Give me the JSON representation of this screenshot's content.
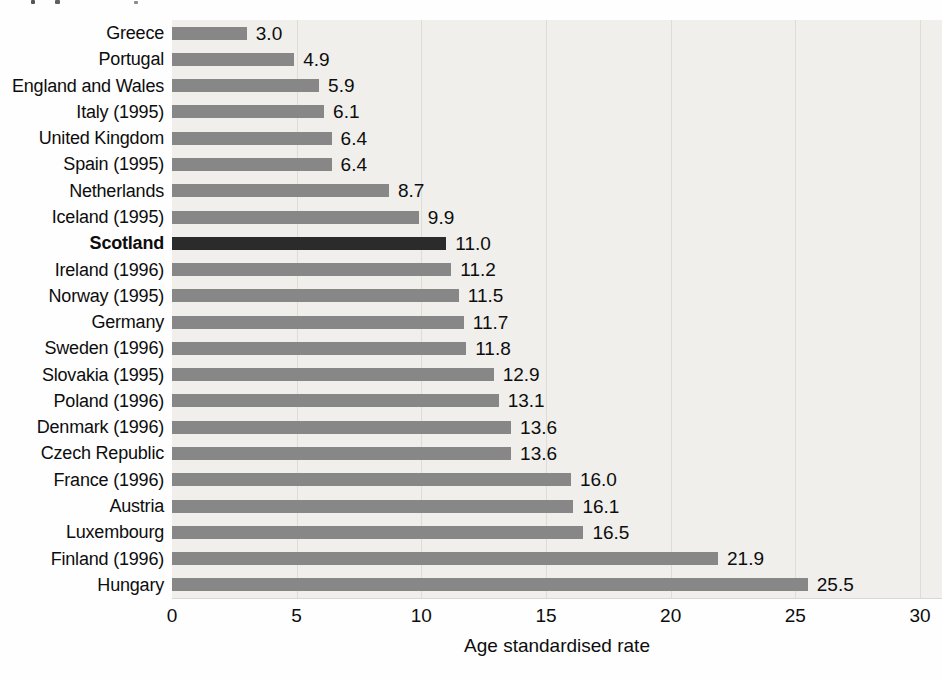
{
  "figure": {
    "background": "#fefefe",
    "text_color": "#0d0d0d"
  },
  "chart_data": {
    "type": "bar",
    "orientation": "horizontal",
    "title": "",
    "xlabel": "Age standardised rate",
    "ylabel": "",
    "xlim": [
      0,
      30.9
    ],
    "xticks": [
      "0",
      "5",
      "10",
      "15",
      "20",
      "25",
      "30"
    ],
    "grid": true,
    "legend": false,
    "plot_background": "#f0efec",
    "gridline_color": "#dddcd7",
    "bar_color": "#878787",
    "highlight_color": "#2b2b2b",
    "highlight_label": "Scotland",
    "categories": [
      "Greece",
      "Portugal",
      "England and Wales",
      "Italy (1995)",
      "United Kingdom",
      "Spain (1995)",
      "Netherlands",
      "Iceland (1995)",
      "Scotland",
      "Ireland (1996)",
      "Norway (1995)",
      "Germany",
      "Sweden (1996)",
      "Slovakia (1995)",
      "Poland (1996)",
      "Denmark (1996)",
      "Czech Republic",
      "France (1996)",
      "Austria",
      "Luxembourg",
      "Finland (1996)",
      "Hungary"
    ],
    "values": [
      3.0,
      4.9,
      5.9,
      6.1,
      6.4,
      6.4,
      8.7,
      9.9,
      11.0,
      11.2,
      11.5,
      11.7,
      11.8,
      12.9,
      13.1,
      13.6,
      13.6,
      16.0,
      16.1,
      16.5,
      21.9,
      25.5
    ],
    "value_labels": [
      "3.0",
      "4.9",
      "5.9",
      "6.1",
      "6.4",
      "6.4",
      "8.7",
      "9.9",
      "11.0",
      "11.2",
      "11.5",
      "11.7",
      "11.8",
      "12.9",
      "13.1",
      "13.6",
      "13.6",
      "16.0",
      "16.1",
      "16.5",
      "21.9",
      "25.5"
    ]
  }
}
